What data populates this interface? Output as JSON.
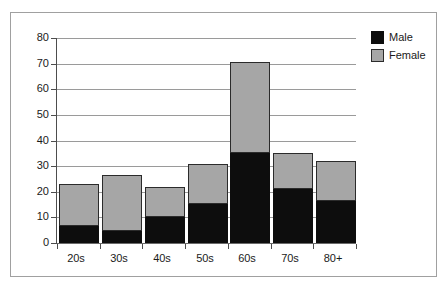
{
  "chart_data": {
    "type": "bar",
    "title": "",
    "xlabel": "",
    "ylabel": "",
    "stacked": true,
    "grid": true,
    "legend_position": "right",
    "ylim": [
      0,
      80
    ],
    "yticks": [
      0,
      10,
      20,
      30,
      40,
      50,
      60,
      70,
      80
    ],
    "ytick_labels": [
      "0",
      "10",
      "20",
      "30",
      "40",
      "50",
      "60",
      "70",
      "80"
    ],
    "categories": [
      "20s",
      "30s",
      "40s",
      "50s",
      "60s",
      "70s",
      "80+"
    ],
    "series": [
      {
        "name": "Male",
        "color": "#0d0d0d",
        "values": [
          6.8,
          4.5,
          10.0,
          15.3,
          35.0,
          21.0,
          16.5
        ]
      },
      {
        "name": "Female",
        "color": "#a6a6a6",
        "values": [
          16.2,
          22.0,
          11.7,
          15.4,
          35.5,
          14.0,
          15.5
        ]
      }
    ],
    "totals": [
      23.0,
      26.5,
      21.7,
      30.7,
      70.5,
      35.0,
      32.0
    ]
  },
  "legend": {
    "items": [
      {
        "label": "Male",
        "swatch": "male-swatch"
      },
      {
        "label": "Female",
        "swatch": "female-swatch"
      }
    ]
  }
}
